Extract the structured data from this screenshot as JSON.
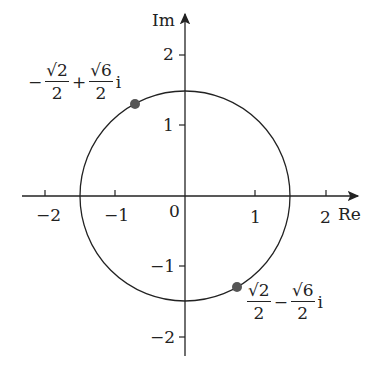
{
  "axes": {
    "x_label": "Re",
    "y_label": "Im",
    "origin_label": "0",
    "x_ticks": [
      "−2",
      "−1",
      "1",
      "2"
    ],
    "y_ticks": [
      "2",
      "1",
      "−1",
      "−2"
    ]
  },
  "circle": {
    "center": [
      0,
      0
    ],
    "radius": 1.5
  },
  "points": [
    {
      "label_sign": "−",
      "re_num": "√2",
      "re_den": "2",
      "op": "+",
      "im_num": "√6",
      "im_den": "2",
      "i": "i",
      "coords": [
        -0.707,
        1.225
      ]
    },
    {
      "label_sign": "",
      "re_num": "√2",
      "re_den": "2",
      "op": "−",
      "im_num": "√6",
      "im_den": "2",
      "i": "i",
      "coords": [
        0.707,
        -1.225
      ]
    }
  ],
  "colors": {
    "axis": "#222222",
    "point": "#555555"
  }
}
